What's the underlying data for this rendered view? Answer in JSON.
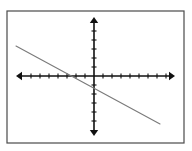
{
  "figure": {
    "title": "",
    "background_color": "#ffffff",
    "frame": {
      "name": "image-border",
      "x": 7,
      "y": 11,
      "width": 177,
      "height": 132,
      "stroke_color": "#4a4a4a",
      "stroke_width": 1.2
    }
  },
  "chart_data": {
    "type": "line",
    "title": "",
    "xlabel": "",
    "ylabel": "",
    "grid": false,
    "legend": null,
    "axis_style": {
      "color": "#111111",
      "stroke_width": 1.6,
      "arrowheads": "both-ends-solid-triangle",
      "tick_length": 5,
      "tick_spacing_px": 9,
      "tick_labels_shown": false
    },
    "origin_px": {
      "x": 94,
      "y": 76
    },
    "unit_px": 9,
    "x_axis": {
      "name": "x-axis",
      "y_px": 76,
      "start_px": 16,
      "end_px": 175,
      "xlim": [
        -8.7,
        9.0
      ],
      "tick_count_left": 8,
      "tick_count_right": 8
    },
    "y_axis": {
      "name": "y-axis",
      "x_px": 94,
      "start_px": 17,
      "end_px": 136,
      "ylim": [
        -6.7,
        6.6
      ],
      "tick_count_up": 6,
      "tick_count_down": 6
    },
    "series": [
      {
        "name": "linear-function",
        "color": "#7a7a7a",
        "stroke_width": 1.1,
        "x": [
          -8.67,
          7.33
        ],
        "y": [
          3.33,
          -5.33
        ],
        "endpoints_px": [
          {
            "x": 16,
            "y": 46
          },
          {
            "x": 160,
            "y": 124
          }
        ],
        "slope": -0.54,
        "y_intercept": -1.22,
        "x_intercept": -2.67,
        "equation": "y = -0.54x - 1.22"
      }
    ]
  }
}
